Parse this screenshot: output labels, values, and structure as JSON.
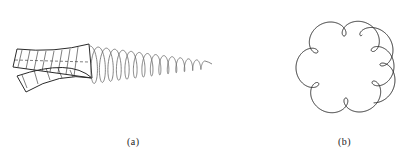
{
  "figure": {
    "panels": [
      {
        "id": "a",
        "label": "(a)",
        "description": "Twisted drill bit with trailing helical spring of decreasing loop size",
        "helix": {
          "start_x": 90,
          "end_x": 205,
          "center_y": 65,
          "loops": 14,
          "start_radius_y": 19,
          "end_radius_y": 4
        }
      },
      {
        "id": "b",
        "label": "(b)",
        "description": "Closed looping curve (epitrochoid-like) with six small loops and a doubled strand on the right",
        "curve": {
          "center_x": 345,
          "center_y": 67,
          "big_radius": 40,
          "loops": 6
        }
      }
    ]
  },
  "colors": {
    "stroke": "#2a2a2a",
    "helix": "#666666",
    "background": "#ffffff"
  }
}
